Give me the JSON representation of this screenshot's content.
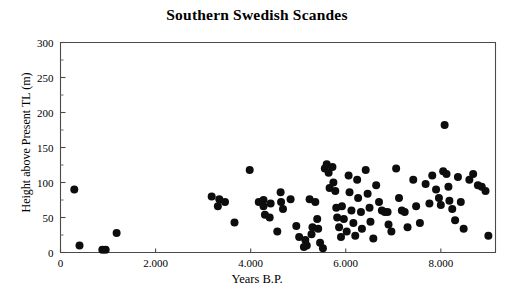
{
  "chart_data": {
    "type": "scatter",
    "title": "Southern Swedish Scandes",
    "xlabel": "Years B.P.",
    "ylabel": "Height above Present TL (m)",
    "xlim": [
      0,
      9150
    ],
    "ylim": [
      0,
      300
    ],
    "xticks": [
      0,
      2000,
      4000,
      6000,
      8000
    ],
    "xtick_labels": [
      "0",
      "2.000",
      "4.000",
      "6.000",
      "8.000"
    ],
    "yticks": [
      0,
      50,
      100,
      150,
      200,
      250,
      300
    ],
    "ytick_labels": [
      "0",
      "50",
      "100",
      "150",
      "200",
      "250",
      "300"
    ],
    "y_minor_ticks": [
      25,
      75,
      125,
      175,
      225,
      275
    ],
    "grid": false,
    "legend": null,
    "marker": "filled-circle",
    "marker_color": "#0d0d0d",
    "marker_size_px": 8,
    "points": [
      [
        290,
        90
      ],
      [
        400,
        10
      ],
      [
        880,
        4
      ],
      [
        950,
        4
      ],
      [
        1180,
        28
      ],
      [
        3180,
        80
      ],
      [
        3340,
        76
      ],
      [
        3460,
        72
      ],
      [
        3310,
        66
      ],
      [
        3660,
        43
      ],
      [
        3980,
        118
      ],
      [
        4270,
        75
      ],
      [
        4300,
        54
      ],
      [
        4170,
        72
      ],
      [
        4270,
        66
      ],
      [
        4420,
        70
      ],
      [
        4400,
        50
      ],
      [
        4630,
        86
      ],
      [
        4640,
        72
      ],
      [
        4680,
        62
      ],
      [
        4560,
        30
      ],
      [
        4840,
        76
      ],
      [
        4960,
        38
      ],
      [
        5020,
        22
      ],
      [
        5120,
        8
      ],
      [
        5180,
        10
      ],
      [
        5150,
        18
      ],
      [
        5280,
        26
      ],
      [
        5300,
        36
      ],
      [
        5240,
        76
      ],
      [
        5360,
        72
      ],
      [
        5400,
        48
      ],
      [
        5420,
        34
      ],
      [
        5460,
        14
      ],
      [
        5520,
        6
      ],
      [
        5560,
        120
      ],
      [
        5600,
        126
      ],
      [
        5640,
        114
      ],
      [
        5660,
        92
      ],
      [
        5720,
        122
      ],
      [
        5740,
        100
      ],
      [
        5780,
        88
      ],
      [
        5800,
        64
      ],
      [
        5820,
        50
      ],
      [
        5860,
        36
      ],
      [
        5900,
        22
      ],
      [
        5920,
        66
      ],
      [
        5960,
        48
      ],
      [
        6020,
        30
      ],
      [
        6060,
        110
      ],
      [
        6080,
        86
      ],
      [
        6120,
        60
      ],
      [
        6160,
        42
      ],
      [
        6200,
        24
      ],
      [
        6240,
        104
      ],
      [
        6260,
        78
      ],
      [
        6320,
        58
      ],
      [
        6340,
        34
      ],
      [
        6420,
        118
      ],
      [
        6460,
        84
      ],
      [
        6500,
        64
      ],
      [
        6520,
        44
      ],
      [
        6580,
        20
      ],
      [
        6640,
        96
      ],
      [
        6700,
        72
      ],
      [
        6760,
        60
      ],
      [
        6820,
        58
      ],
      [
        6880,
        58
      ],
      [
        6900,
        40
      ],
      [
        6960,
        30
      ],
      [
        7060,
        120
      ],
      [
        7120,
        78
      ],
      [
        7180,
        60
      ],
      [
        7240,
        58
      ],
      [
        7300,
        36
      ],
      [
        7420,
        104
      ],
      [
        7480,
        66
      ],
      [
        7560,
        42
      ],
      [
        7680,
        98
      ],
      [
        7760,
        70
      ],
      [
        7820,
        110
      ],
      [
        7900,
        90
      ],
      [
        7960,
        78
      ],
      [
        8000,
        68
      ],
      [
        8050,
        116
      ],
      [
        8080,
        182
      ],
      [
        8120,
        112
      ],
      [
        8160,
        94
      ],
      [
        8180,
        74
      ],
      [
        8240,
        62
      ],
      [
        8300,
        46
      ],
      [
        8360,
        108
      ],
      [
        8420,
        72
      ],
      [
        8480,
        34
      ],
      [
        8600,
        104
      ],
      [
        8680,
        112
      ],
      [
        8780,
        96
      ],
      [
        8860,
        94
      ],
      [
        8940,
        88
      ],
      [
        9000,
        24
      ]
    ]
  }
}
